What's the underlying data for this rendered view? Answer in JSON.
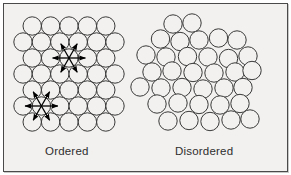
{
  "figure": {
    "title": "",
    "background_color": "#f2f1ef",
    "border_color": "#4a4a4a",
    "circle_stroke_color": "#3a3a3a",
    "circle_fill_color": "#f2f1ef",
    "arrow_color": "#000000",
    "label_color": "#2e2e2e",
    "width": 291,
    "height": 175
  },
  "labels": {
    "ordered": "Ordered",
    "disordered": "Disordered"
  },
  "chart_data": {
    "type": "diagram",
    "panels": [
      {
        "name": "ordered",
        "label": "Ordered",
        "description": "Hexagonal close-packed regular lattice of equal circles",
        "circle_radius": 9.2,
        "packing": "hexagonal close-packed",
        "row_spacing": 16.0,
        "column_spacing": 18.4,
        "row_counts": [
          5,
          6,
          5,
          6,
          5,
          6,
          5
        ],
        "circles": [
          [
            32.2,
            26.0
          ],
          [
            50.6,
            26.0
          ],
          [
            69.0,
            26.0
          ],
          [
            87.4,
            26.0
          ],
          [
            105.8,
            26.0
          ],
          [
            23.0,
            42.0
          ],
          [
            41.4,
            42.0
          ],
          [
            59.8,
            42.0
          ],
          [
            78.2,
            42.0
          ],
          [
            96.6,
            42.0
          ],
          [
            115.0,
            42.0
          ],
          [
            32.2,
            58.0
          ],
          [
            50.6,
            58.0
          ],
          [
            69.0,
            58.0
          ],
          [
            87.4,
            58.0
          ],
          [
            105.8,
            58.0
          ],
          [
            23.0,
            74.0
          ],
          [
            41.4,
            74.0
          ],
          [
            59.8,
            74.0
          ],
          [
            78.2,
            74.0
          ],
          [
            96.6,
            74.0
          ],
          [
            115.0,
            74.0
          ],
          [
            32.2,
            90.0
          ],
          [
            50.6,
            90.0
          ],
          [
            69.0,
            90.0
          ],
          [
            87.4,
            90.0
          ],
          [
            105.8,
            90.0
          ],
          [
            23.0,
            106.0
          ],
          [
            41.4,
            106.0
          ],
          [
            59.8,
            106.0
          ],
          [
            78.2,
            106.0
          ],
          [
            96.6,
            106.0
          ],
          [
            115.0,
            106.0
          ],
          [
            32.2,
            122.0
          ],
          [
            50.6,
            122.0
          ],
          [
            69.0,
            122.0
          ],
          [
            87.4,
            122.0
          ],
          [
            105.8,
            122.0
          ]
        ],
        "coordination_stars": [
          {
            "center": [
              69.0,
              58.0
            ],
            "arrow_count": 6,
            "neighbor_targets": [
              [
                50.6,
                58.0
              ],
              [
                87.4,
                58.0
              ],
              [
                59.8,
                42.0
              ],
              [
                78.2,
                42.0
              ],
              [
                59.8,
                74.0
              ],
              [
                78.2,
                74.0
              ]
            ]
          },
          {
            "center": [
              41.4,
              106.0
            ],
            "arrow_count": 6,
            "neighbor_targets": [
              [
                23.0,
                106.0
              ],
              [
                59.8,
                106.0
              ],
              [
                32.2,
                90.0
              ],
              [
                50.6,
                90.0
              ],
              [
                32.2,
                122.0
              ],
              [
                50.6,
                122.0
              ]
            ]
          }
        ]
      },
      {
        "name": "disordered",
        "label": "Disordered",
        "description": "Random irregular cluster of equal circles with gaps",
        "circle_radius": 9.2,
        "packing": "random / amorphous",
        "circle_count": 35,
        "circles": [
          [
            173.0,
            24.0
          ],
          [
            192.0,
            23.0
          ],
          [
            160.5,
            39.0
          ],
          [
            180.0,
            41.5
          ],
          [
            199.0,
            40.0
          ],
          [
            218.5,
            38.0
          ],
          [
            237.0,
            40.0
          ],
          [
            146.0,
            55.0
          ],
          [
            166.0,
            57.0
          ],
          [
            187.5,
            56.5
          ],
          [
            208.0,
            57.0
          ],
          [
            228.5,
            58.5
          ],
          [
            248.0,
            56.0
          ],
          [
            152.0,
            72.0
          ],
          [
            172.0,
            71.0
          ],
          [
            193.0,
            72.5
          ],
          [
            214.0,
            73.0
          ],
          [
            235.0,
            72.0
          ],
          [
            252.0,
            70.5
          ],
          [
            140.0,
            87.0
          ],
          [
            161.0,
            88.0
          ],
          [
            182.0,
            87.5
          ],
          [
            203.0,
            89.0
          ],
          [
            224.0,
            88.0
          ],
          [
            243.0,
            87.5
          ],
          [
            157.0,
            104.0
          ],
          [
            178.0,
            103.0
          ],
          [
            199.0,
            104.5
          ],
          [
            220.0,
            105.0
          ],
          [
            240.0,
            103.5
          ],
          [
            168.0,
            121.0
          ],
          [
            189.0,
            120.5
          ],
          [
            210.0,
            121.5
          ],
          [
            231.0,
            120.0
          ],
          [
            250.0,
            119.0
          ]
        ]
      }
    ]
  }
}
